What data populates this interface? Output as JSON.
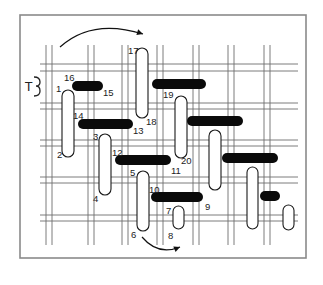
{
  "figure": {
    "symbol_label": "T",
    "frame": {
      "x": 20,
      "y": 15,
      "width": 286,
      "height": 243,
      "border_color": "#8a8a8a"
    },
    "grid": {
      "vertical_pairs_x": [
        [
          46,
          52
        ],
        [
          88,
          94
        ],
        [
          122,
          128
        ],
        [
          157,
          163
        ],
        [
          193,
          199
        ],
        [
          228,
          234
        ],
        [
          264,
          270
        ]
      ],
      "horizontal_pairs_y": [
        [
          64,
          71
        ],
        [
          103,
          109
        ],
        [
          140,
          146
        ],
        [
          177,
          183
        ],
        [
          215,
          221
        ]
      ],
      "line_color": "#6e6e6e"
    },
    "stitch_labels": [
      {
        "text": "1",
        "x": 56,
        "y": 92
      },
      {
        "text": "2",
        "x": 57,
        "y": 158
      },
      {
        "text": "3",
        "x": 93,
        "y": 140
      },
      {
        "text": "4",
        "x": 93,
        "y": 202
      },
      {
        "text": "5",
        "x": 130,
        "y": 176
      },
      {
        "text": "6",
        "x": 131,
        "y": 238
      },
      {
        "text": "7",
        "x": 166,
        "y": 214
      },
      {
        "text": "8",
        "x": 168,
        "y": 239
      },
      {
        "text": "9",
        "x": 205,
        "y": 210
      },
      {
        "text": "10",
        "x": 149,
        "y": 193
      },
      {
        "text": "11",
        "x": 171,
        "y": 174
      },
      {
        "text": "12",
        "x": 112,
        "y": 156
      },
      {
        "text": "13",
        "x": 133,
        "y": 134
      },
      {
        "text": "14",
        "x": 73,
        "y": 119
      },
      {
        "text": "15",
        "x": 103,
        "y": 96
      },
      {
        "text": "16",
        "x": 64,
        "y": 81
      },
      {
        "text": "17",
        "x": 128,
        "y": 54
      },
      {
        "text": "18",
        "x": 146,
        "y": 125
      },
      {
        "text": "19",
        "x": 163,
        "y": 98
      },
      {
        "text": "20",
        "x": 181,
        "y": 164
      }
    ],
    "vertical_loops": [
      {
        "name": "stitch-1-2",
        "x": 62,
        "y": 90,
        "w": 12,
        "h": 67
      },
      {
        "name": "stitch-17-18",
        "x": 136,
        "y": 48,
        "w": 12,
        "h": 70
      },
      {
        "name": "stitch-19-20",
        "x": 175,
        "y": 96,
        "w": 12,
        "h": 62
      },
      {
        "name": "stitch-3-4",
        "x": 99,
        "y": 134,
        "w": 12,
        "h": 61
      },
      {
        "name": "stitch-5-6",
        "x": 137,
        "y": 171,
        "w": 12,
        "h": 60
      },
      {
        "name": "stitch-7-8",
        "x": 173,
        "y": 206,
        "w": 11,
        "h": 23
      },
      {
        "name": "stitch-right-a",
        "x": 209,
        "y": 130,
        "w": 12,
        "h": 60
      },
      {
        "name": "stitch-right-b",
        "x": 247,
        "y": 167,
        "w": 11,
        "h": 62
      },
      {
        "name": "stitch-right-c",
        "x": 283,
        "y": 205,
        "w": 11,
        "h": 25
      }
    ],
    "horizontal_bars": [
      {
        "name": "bar-16-15",
        "x": 72,
        "y": 81,
        "w": 31,
        "h": 10
      },
      {
        "name": "bar-14-13",
        "x": 78,
        "y": 119,
        "w": 55,
        "h": 10
      },
      {
        "name": "bar-top-19",
        "x": 152,
        "y": 79,
        "w": 54,
        "h": 10
      },
      {
        "name": "bar-right-1",
        "x": 187,
        "y": 116,
        "w": 56,
        "h": 10
      },
      {
        "name": "bar-12-11",
        "x": 115,
        "y": 155,
        "w": 56,
        "h": 10
      },
      {
        "name": "bar-right-2",
        "x": 222,
        "y": 153,
        "w": 56,
        "h": 10
      },
      {
        "name": "bar-10-9",
        "x": 151,
        "y": 192,
        "w": 52,
        "h": 10
      },
      {
        "name": "bar-right-3",
        "x": 260,
        "y": 191,
        "w": 20,
        "h": 10
      }
    ],
    "arrows": [
      {
        "name": "top-curved-arrow",
        "from": [
          60,
          47
        ],
        "ctrl": [
          92,
          18
        ],
        "to": [
          143,
          34
        ]
      },
      {
        "name": "bottom-curved-arrow",
        "from": [
          142,
          237
        ],
        "ctrl": [
          158,
          256
        ],
        "to": [
          180,
          247
        ]
      }
    ]
  }
}
